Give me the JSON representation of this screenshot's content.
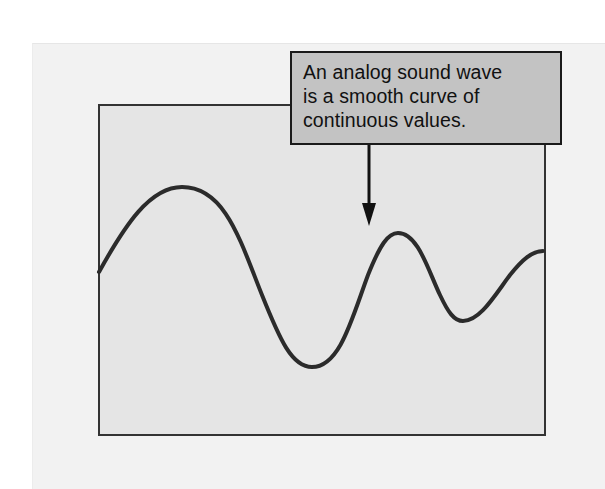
{
  "diagram": {
    "title": "Analog sound wave",
    "callout": {
      "lines": [
        "An analog sound wave",
        "is a smooth curve of",
        "continuous values."
      ]
    },
    "colors": {
      "page_background": "#ffffff",
      "outer_panel": "#f2f2f2",
      "plot_fill": "#e5e5e5",
      "plot_border": "#333333",
      "callout_fill": "#c3c3c3",
      "callout_border": "#1a1a1a",
      "wave_stroke": "#2b2b2b",
      "arrow": "#111111"
    },
    "wave": {
      "description": "Smooth continuous waveform with decreasing amplitude and increasing frequency",
      "points": [
        {
          "x": 99,
          "y": 272
        },
        {
          "x": 182,
          "y": 187
        },
        {
          "x": 310,
          "y": 367
        },
        {
          "x": 398,
          "y": 233
        },
        {
          "x": 462,
          "y": 321
        },
        {
          "x": 543,
          "y": 251
        }
      ]
    },
    "arrow": {
      "from": {
        "x": 369,
        "y": 144
      },
      "to": {
        "x": 369,
        "y": 226
      }
    }
  }
}
